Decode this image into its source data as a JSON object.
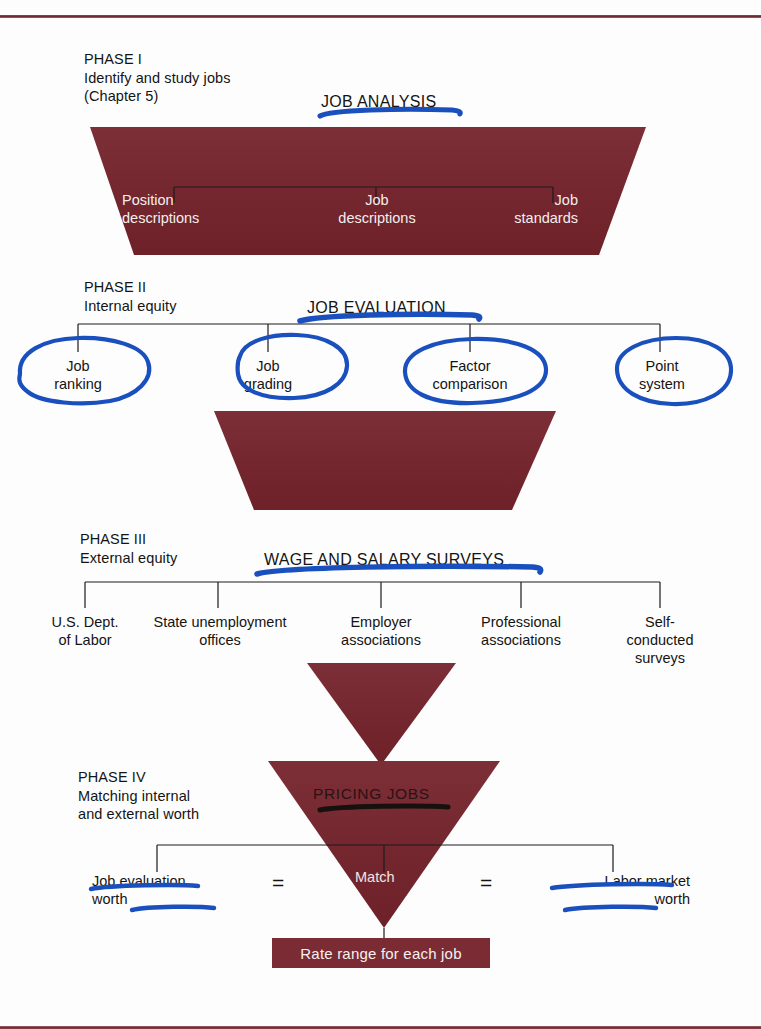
{
  "diagram": {
    "accent_color": "#7a2b33",
    "annotation_color": "#1a4fbe",
    "annotation_dark_color": "#1a1a1a"
  },
  "phase1": {
    "phase_label": "PHASE I\nIdentify and study jobs\n(Chapter 5)",
    "section_title": "JOB ANALYSIS",
    "nodes": [
      {
        "label": "Position\ndescriptions"
      },
      {
        "label": "Job\ndescriptions"
      },
      {
        "label": "Job\nstandards"
      }
    ]
  },
  "phase2": {
    "phase_label": "PHASE II\nInternal equity",
    "section_title": "JOB EVALUATION",
    "nodes": [
      {
        "label": "Job\nranking"
      },
      {
        "label": "Job\ngrading"
      },
      {
        "label": "Factor\ncomparison"
      },
      {
        "label": "Point\nsystem"
      }
    ]
  },
  "phase3": {
    "phase_label": "PHASE III\nExternal equity",
    "section_title": "WAGE AND SALARY SURVEYS",
    "nodes": [
      {
        "label": "U.S. Dept.\nof Labor"
      },
      {
        "label": "State unemployment\noffices"
      },
      {
        "label": "Employer\nassociations"
      },
      {
        "label": "Professional\nassociations"
      },
      {
        "label": "Self-\nconducted\nsurveys"
      }
    ]
  },
  "phase4": {
    "phase_label": "PHASE IV\nMatching internal\nand external worth",
    "section_title": "PRICING JOBS",
    "center_label": "Match",
    "left_label": "Job evaluation\nworth",
    "right_label": "Labor market\nworth",
    "equals_left": "=",
    "equals_right": "=",
    "outcome_label": "Rate range for each job"
  },
  "annotations": {
    "underlines": [
      {
        "target": "JOB ANALYSIS"
      },
      {
        "target": "JOB EVALUATION"
      },
      {
        "target": "WAGE AND SALARY SURVEYS"
      },
      {
        "target": "PRICING JOBS"
      },
      {
        "target": "Job evaluation worth"
      },
      {
        "target": "Labor market worth"
      }
    ],
    "circles": [
      {
        "target": "Job ranking"
      },
      {
        "target": "Job grading"
      },
      {
        "target": "Factor comparison"
      },
      {
        "target": "Point system"
      }
    ]
  }
}
